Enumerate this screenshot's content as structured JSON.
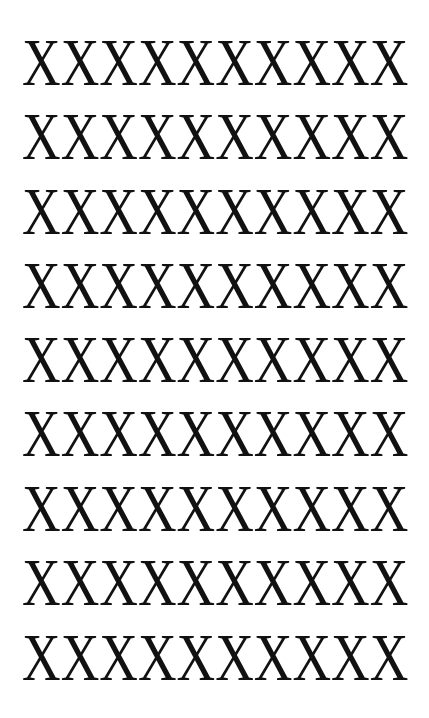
{
  "rows": [
    {
      "text": "XXXXXXXXXX",
      "top": 30
    },
    {
      "text": "XXXXXXXXXX",
      "top": 104
    },
    {
      "text": "XXXXXXXXXX",
      "top": 179
    },
    {
      "text": "XXXXXXXXXX",
      "top": 253
    },
    {
      "text": "XXXXXXXXXX",
      "top": 327
    },
    {
      "text": "XXXXXXXXXX",
      "top": 401
    },
    {
      "text": "XXXXXXXXXX",
      "top": 476
    },
    {
      "text": "XXXXXXXXXX",
      "top": 550
    },
    {
      "text": "XXXXXXXXXX",
      "top": 625
    }
  ],
  "colors": {
    "text": "#111111",
    "background": "#ffffff"
  }
}
